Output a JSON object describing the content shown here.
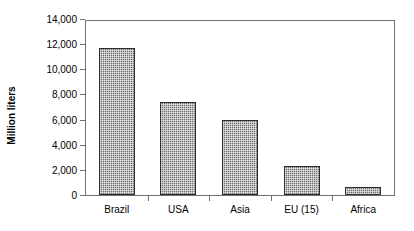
{
  "chart_data": {
    "type": "bar",
    "title": "",
    "xlabel": "",
    "ylabel": "Million liters",
    "categories": [
      "Brazil",
      "USA",
      "Asia",
      "EU (15)",
      "Africa"
    ],
    "values": [
      11800,
      7460,
      6000,
      2300,
      620
    ],
    "ylim": [
      0,
      14000
    ],
    "ytick_labels": [
      "14,000",
      "12,000",
      "10,000",
      "8,000",
      "6,000",
      "4,000",
      "2,000",
      "0"
    ],
    "ytick_values": [
      14000,
      12000,
      10000,
      8000,
      6000,
      4000,
      2000,
      0
    ],
    "grid": false,
    "legend": "none",
    "series": [
      {
        "name": "Production",
        "values": [
          11800,
          7460,
          6000,
          2300,
          620
        ]
      }
    ],
    "colors": {
      "bar_fill": "#6e6e6e",
      "bar_border": "#2e2e2e",
      "axis": "#6f6f6f",
      "text": "#000000",
      "background": "#ffffff"
    }
  }
}
